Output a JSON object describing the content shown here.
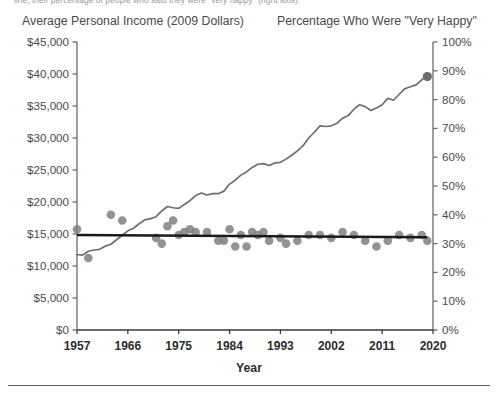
{
  "clipped_caption": "line, their percentage of people who said they were \"very happy\" (right axis).",
  "axis_titles": {
    "left": "Average Personal Income (2009 Dollars)",
    "right": "Percentage Who Were \"Very Happy\""
  },
  "xaxis_name": "Year",
  "colors": {
    "income_line": "#6e6e6e",
    "scatter_point": "#808080",
    "trend_line": "#1a1a1a",
    "axis": "#6b6b6b",
    "tick_text": "#4a4a4a",
    "xlabel_text": "#2d2d2d",
    "background": "#ffffff"
  },
  "chart_data": {
    "type": "line",
    "title": "",
    "subtitle": "",
    "xlabel": "Year",
    "grid": false,
    "legend": "none",
    "x": [
      1957,
      1966,
      1975,
      1984,
      1993,
      2002,
      2011,
      2020
    ],
    "xlim": [
      1957,
      2020
    ],
    "xticks": [
      "1957",
      "1966",
      "1975",
      "1984",
      "1993",
      "2002",
      "2011",
      "2020"
    ],
    "axes": [
      {
        "side": "left",
        "label": "Average Personal Income (2009 Dollars)",
        "lim": [
          0,
          45000
        ],
        "ticks": [
          0,
          5000,
          10000,
          15000,
          20000,
          25000,
          30000,
          35000,
          40000,
          45000
        ],
        "ticklabels": [
          "$0",
          "$5,000",
          "$10,000",
          "$15,000",
          "$20,000",
          "$25,000",
          "$30,000",
          "$35,000",
          "$40,000",
          "$45,000"
        ]
      },
      {
        "side": "right",
        "label": "Percentage Who Were \"Very Happy\"",
        "lim": [
          0,
          100
        ],
        "ticks": [
          0,
          10,
          20,
          30,
          40,
          50,
          60,
          70,
          80,
          90,
          100
        ],
        "ticklabels": [
          "0%",
          "10%",
          "20%",
          "30%",
          "40%",
          "50%",
          "60%",
          "70%",
          "80%",
          "90%",
          "100%"
        ]
      }
    ],
    "series": [
      {
        "name": "Average Personal Income (2009 Dollars)",
        "type": "line",
        "axis": "left",
        "color": "#6e6e6e",
        "endpoint_marker": true,
        "points": [
          [
            1957,
            11800
          ],
          [
            1958,
            11700
          ],
          [
            1959,
            12300
          ],
          [
            1960,
            12500
          ],
          [
            1961,
            12600
          ],
          [
            1962,
            13100
          ],
          [
            1963,
            13400
          ],
          [
            1964,
            14100
          ],
          [
            1965,
            14800
          ],
          [
            1966,
            15500
          ],
          [
            1967,
            15900
          ],
          [
            1968,
            16600
          ],
          [
            1969,
            17200
          ],
          [
            1970,
            17400
          ],
          [
            1971,
            17700
          ],
          [
            1972,
            18600
          ],
          [
            1973,
            19300
          ],
          [
            1974,
            19100
          ],
          [
            1975,
            19000
          ],
          [
            1976,
            19600
          ],
          [
            1977,
            20200
          ],
          [
            1978,
            21000
          ],
          [
            1979,
            21400
          ],
          [
            1980,
            21100
          ],
          [
            1981,
            21300
          ],
          [
            1982,
            21300
          ],
          [
            1983,
            21700
          ],
          [
            1984,
            22800
          ],
          [
            1985,
            23400
          ],
          [
            1986,
            24200
          ],
          [
            1987,
            24700
          ],
          [
            1988,
            25400
          ],
          [
            1989,
            25900
          ],
          [
            1990,
            26000
          ],
          [
            1991,
            25700
          ],
          [
            1992,
            26100
          ],
          [
            1993,
            26200
          ],
          [
            1994,
            26700
          ],
          [
            1995,
            27300
          ],
          [
            1996,
            28000
          ],
          [
            1997,
            28800
          ],
          [
            1998,
            30000
          ],
          [
            1999,
            30900
          ],
          [
            2000,
            31900
          ],
          [
            2001,
            31800
          ],
          [
            2002,
            31900
          ],
          [
            2003,
            32300
          ],
          [
            2004,
            33100
          ],
          [
            2005,
            33500
          ],
          [
            2006,
            34500
          ],
          [
            2007,
            35200
          ],
          [
            2008,
            34900
          ],
          [
            2009,
            34300
          ],
          [
            2010,
            34700
          ],
          [
            2011,
            35200
          ],
          [
            2012,
            36200
          ],
          [
            2013,
            35900
          ],
          [
            2014,
            36800
          ],
          [
            2015,
            37700
          ],
          [
            2016,
            38000
          ],
          [
            2017,
            38300
          ],
          [
            2018,
            39100
          ],
          [
            2019,
            39600
          ]
        ]
      },
      {
        "name": "Percentage Who Were \"Very Happy\"",
        "type": "scatter",
        "axis": "right",
        "color": "#808080",
        "points": [
          [
            1957,
            35
          ],
          [
            1959,
            25
          ],
          [
            1963,
            40
          ],
          [
            1965,
            38
          ],
          [
            1971,
            32
          ],
          [
            1972,
            30
          ],
          [
            1973,
            36
          ],
          [
            1974,
            38
          ],
          [
            1975,
            33
          ],
          [
            1976,
            34
          ],
          [
            1977,
            35
          ],
          [
            1978,
            34
          ],
          [
            1980,
            34
          ],
          [
            1982,
            31
          ],
          [
            1983,
            31
          ],
          [
            1984,
            35
          ],
          [
            1985,
            29
          ],
          [
            1986,
            33
          ],
          [
            1987,
            29
          ],
          [
            1988,
            34
          ],
          [
            1989,
            33
          ],
          [
            1990,
            34
          ],
          [
            1991,
            31
          ],
          [
            1993,
            32
          ],
          [
            1994,
            30
          ],
          [
            1996,
            31
          ],
          [
            1998,
            33
          ],
          [
            2000,
            33
          ],
          [
            2002,
            32
          ],
          [
            2004,
            34
          ],
          [
            2006,
            33
          ],
          [
            2008,
            31
          ],
          [
            2010,
            29
          ],
          [
            2012,
            31
          ],
          [
            2014,
            33
          ],
          [
            2016,
            32
          ],
          [
            2018,
            33
          ],
          [
            2019,
            31
          ]
        ]
      },
      {
        "name": "Happiness trend line",
        "type": "trend",
        "axis": "right",
        "color": "#1a1a1a",
        "points": [
          [
            1957,
            33.0
          ],
          [
            2019,
            32.2
          ]
        ]
      }
    ]
  }
}
